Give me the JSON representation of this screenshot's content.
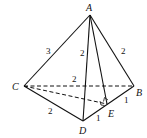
{
  "diagram": {
    "points": {
      "A": {
        "label": "A",
        "x": 90,
        "y": 15
      },
      "B": {
        "label": "B",
        "x": 134,
        "y": 86
      },
      "C": {
        "label": "C",
        "x": 24,
        "y": 86
      },
      "D": {
        "label": "D",
        "x": 83,
        "y": 121
      },
      "E": {
        "label": "E",
        "x": 107,
        "y": 104
      }
    },
    "edge_labels": {
      "AC": "3",
      "AD": "2",
      "AB": "2",
      "CB": "2",
      "CD": "2",
      "EB": "1",
      "DE": "1"
    }
  }
}
